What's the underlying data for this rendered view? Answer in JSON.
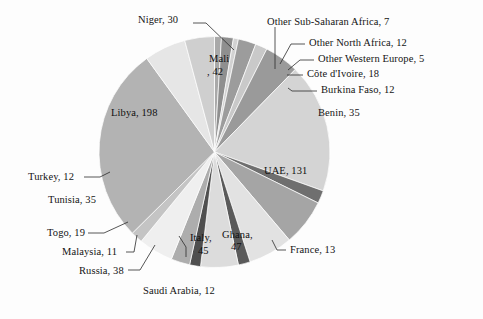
{
  "chart_data": {
    "type": "pie",
    "title": "",
    "subtitle": "",
    "xlabel": "",
    "ylabel": "",
    "legend_position": "none",
    "grid": false,
    "label_format": "name, value",
    "total": 702,
    "start_angle_deg": 0,
    "direction": "clockwise",
    "categories": [
      "Other Sub-Saharan Africa",
      "Other North Africa",
      "Other Western Europe",
      "Côte d'Ivoire",
      "Burkina Faso",
      "Benin",
      "UAE",
      "France",
      "Ghana",
      "Italy",
      "Saudi Arabia",
      "Russia",
      "Malaysia",
      "Togo",
      "Tunisia",
      "Turkey",
      "Libya",
      "Mali",
      "Niger"
    ],
    "values": [
      7,
      12,
      5,
      18,
      12,
      35,
      131,
      13,
      47,
      45,
      12,
      38,
      11,
      19,
      35,
      12,
      198,
      42,
      30
    ],
    "colors": [
      "#a9a9a9",
      "#8f8f8f",
      "#d2d2d2",
      "#9c9c9c",
      "#c9c9c9",
      "#9a9a9a",
      "#d4d4d4",
      "#6f6f6f",
      "#a5a5a5",
      "#e2e2e2",
      "#5a5a5a",
      "#dcdcdc",
      "#4f4f4f",
      "#adadad",
      "#efefef",
      "#c4c4c4",
      "#b3b3b3",
      "#e6e6e6",
      "#cfcfcf"
    ],
    "slice_labels": [
      "Other Sub-Saharan Africa, 7",
      "Other North Africa, 12",
      "Other Western Europe, 5",
      "Côte d'Ivoire, 18",
      "Burkina Faso, 12",
      "Benin, 35",
      "UAE, 131",
      "France, 13",
      "Ghana, 47",
      "Italy, 45",
      "Saudi Arabia, 12",
      "Russia, 38",
      "Malaysia, 11",
      "Togo, 19",
      "Tunisia, 35",
      "Turkey, 12",
      "Libya, 198",
      "Mali, 42",
      "Niger, 30"
    ]
  },
  "labels": {
    "other_sub_saharan_africa": "Other Sub-Saharan Africa, 7",
    "other_north_africa": "Other North Africa, 12",
    "other_western_europe": "Other Western Europe, 5",
    "cote_divoire": "Côte d'Ivoire, 18",
    "burkina_faso": "Burkina Faso, 12",
    "benin": "Benin, 35",
    "uae": "UAE, 131",
    "france": "France, 13",
    "ghana_name": "Ghana,",
    "ghana_value": "47",
    "italy_name": "Italy,",
    "italy_value": "45",
    "saudi_arabia": "Saudi Arabia, 12",
    "russia": "Russia, 38",
    "malaysia": "Malaysia, 11",
    "togo": "Togo, 19",
    "tunisia": "Tunisia, 35",
    "turkey": "Turkey, 12",
    "libya": "Libya, 198",
    "mali_name": "Mali",
    "mali_value": ", 42",
    "niger": "Niger, 30"
  }
}
